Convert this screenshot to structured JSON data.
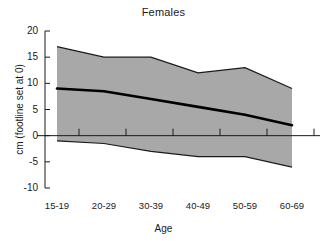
{
  "chart_data": {
    "type": "area",
    "title": "Females",
    "xlabel": "Age",
    "ylabel": "cm (footline set at 0)",
    "categories": [
      "15-19",
      "20-29",
      "30-39",
      "40-49",
      "50-59",
      "60-69"
    ],
    "ylim": [
      -10,
      20
    ],
    "yticks": [
      -10,
      -5,
      0,
      5,
      10,
      15,
      20
    ],
    "ytick_labels": [
      "-10",
      "-5",
      "0",
      "5",
      "10",
      "15",
      "20"
    ],
    "grid": false,
    "legend": "none",
    "zero_reference_line": 0,
    "series": [
      {
        "name": "upper band",
        "values": [
          17,
          15,
          15,
          12,
          13,
          9
        ]
      },
      {
        "name": "median",
        "values": [
          9,
          8.5,
          7,
          5.5,
          4,
          2
        ]
      },
      {
        "name": "lower band",
        "values": [
          -1,
          -1.5,
          -3,
          -4,
          -4,
          -6
        ]
      }
    ],
    "colors": {
      "band_fill": "#a8a8a8",
      "band_edge": "#1a1a1a",
      "median_line": "#000000",
      "axis": "#1a1a1a",
      "background": "#ffffff"
    }
  }
}
